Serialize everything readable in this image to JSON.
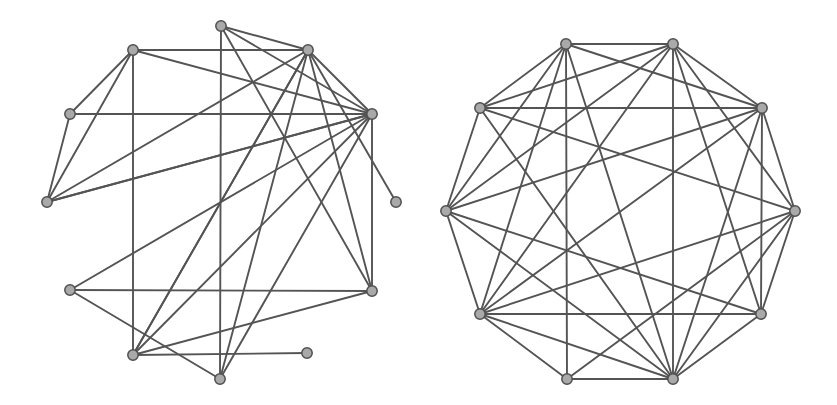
{
  "figure": {
    "title": "",
    "background_color": "#ffffff",
    "width": 837,
    "height": 405,
    "panel_count": 2
  },
  "style": {
    "edge_color": "#545454",
    "edge_width": 1.9,
    "node_fill": "#a9a9a9",
    "node_stroke": "#4f4f4f",
    "node_stroke_width": 1.5,
    "node_radius": 5.2
  },
  "chart_data": {
    "type": "diagram",
    "subtype": "node-link-graph",
    "title": "",
    "xlabel": "",
    "ylabel": "",
    "graphs": [
      {
        "name": "left-graph",
        "layout": "spring",
        "node_count": 12,
        "edge_count": 28,
        "nodes": [
          {
            "id": 0,
            "x": 221,
            "y": 26
          },
          {
            "id": 1,
            "x": 133,
            "y": 50
          },
          {
            "id": 2,
            "x": 308,
            "y": 50
          },
          {
            "id": 3,
            "x": 372,
            "y": 114
          },
          {
            "id": 4,
            "x": 70,
            "y": 114
          },
          {
            "id": 5,
            "x": 47,
            "y": 202
          },
          {
            "id": 6,
            "x": 396,
            "y": 202
          },
          {
            "id": 7,
            "x": 372,
            "y": 291
          },
          {
            "id": 8,
            "x": 70,
            "y": 290
          },
          {
            "id": 9,
            "x": 133,
            "y": 355
          },
          {
            "id": 10,
            "x": 307,
            "y": 353
          },
          {
            "id": 11,
            "x": 220,
            "y": 379
          }
        ],
        "edges": [
          [
            0,
            2
          ],
          [
            0,
            3
          ],
          [
            0,
            7
          ],
          [
            0,
            11
          ],
          [
            1,
            2
          ],
          [
            1,
            3
          ],
          [
            1,
            4
          ],
          [
            1,
            5
          ],
          [
            1,
            9
          ],
          [
            2,
            3
          ],
          [
            2,
            5
          ],
          [
            2,
            6
          ],
          [
            2,
            7
          ],
          [
            2,
            9
          ],
          [
            2,
            11
          ],
          [
            3,
            5
          ],
          [
            3,
            8
          ],
          [
            3,
            9
          ],
          [
            3,
            11
          ],
          [
            4,
            3
          ],
          [
            4,
            5
          ],
          [
            5,
            3
          ],
          [
            7,
            3
          ],
          [
            7,
            9
          ],
          [
            7,
            8
          ],
          [
            8,
            11
          ],
          [
            9,
            10
          ],
          [
            9,
            2
          ]
        ]
      },
      {
        "name": "right-graph",
        "layout": "circular",
        "node_count": 10,
        "edge_count": 35,
        "center_x": 620,
        "center_y": 211,
        "radius": 176,
        "nodes": [
          {
            "id": 0,
            "x": 566,
            "y": 44
          },
          {
            "id": 1,
            "x": 673,
            "y": 44
          },
          {
            "id": 2,
            "x": 762,
            "y": 108
          },
          {
            "id": 3,
            "x": 795,
            "y": 211
          },
          {
            "id": 4,
            "x": 761,
            "y": 314
          },
          {
            "id": 5,
            "x": 673,
            "y": 379
          },
          {
            "id": 6,
            "x": 567,
            "y": 379
          },
          {
            "id": 7,
            "x": 480,
            "y": 314
          },
          {
            "id": 8,
            "x": 446,
            "y": 211
          },
          {
            "id": 9,
            "x": 480,
            "y": 108
          }
        ],
        "edges": [
          [
            0,
            1
          ],
          [
            0,
            2
          ],
          [
            0,
            5
          ],
          [
            0,
            6
          ],
          [
            0,
            7
          ],
          [
            0,
            8
          ],
          [
            0,
            9
          ],
          [
            1,
            2
          ],
          [
            1,
            3
          ],
          [
            1,
            4
          ],
          [
            1,
            5
          ],
          [
            1,
            7
          ],
          [
            1,
            8
          ],
          [
            1,
            9
          ],
          [
            2,
            3
          ],
          [
            2,
            4
          ],
          [
            2,
            5
          ],
          [
            2,
            7
          ],
          [
            2,
            8
          ],
          [
            2,
            9
          ],
          [
            3,
            4
          ],
          [
            3,
            5
          ],
          [
            3,
            6
          ],
          [
            3,
            7
          ],
          [
            3,
            9
          ],
          [
            4,
            5
          ],
          [
            4,
            7
          ],
          [
            4,
            8
          ],
          [
            5,
            6
          ],
          [
            5,
            7
          ],
          [
            5,
            8
          ],
          [
            5,
            9
          ],
          [
            6,
            7
          ],
          [
            7,
            8
          ],
          [
            8,
            9
          ]
        ]
      }
    ]
  }
}
